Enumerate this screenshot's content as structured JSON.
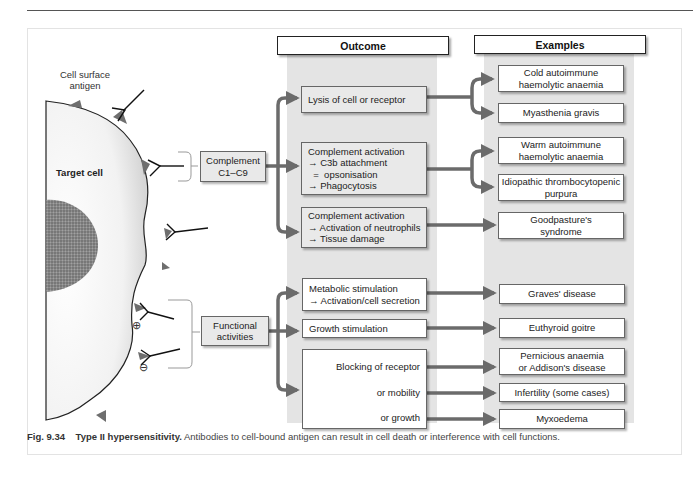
{
  "headers": {
    "outcome": "Outcome",
    "examples": "Examples"
  },
  "cell": {
    "antigen_label_1": "Cell surface",
    "antigen_label_2": "antigen",
    "target_cell_label": "Target cell",
    "plus_sign": "⊕",
    "minus_sign": "⊖"
  },
  "mechanisms": {
    "complement": {
      "line1": "Complement",
      "line2": "C1–C9"
    },
    "functional": {
      "line1": "Functional",
      "line2": "activities"
    }
  },
  "outcomes": [
    {
      "lines": [
        "Lysis of cell or receptor"
      ]
    },
    {
      "lines": [
        "Complement activation",
        "→ C3b attachment",
        "  =  opsonisation",
        "→ Phagocytosis"
      ]
    },
    {
      "lines": [
        "Complement activation",
        "→ Activation of neutrophils",
        "→ Tissue damage"
      ]
    },
    {
      "lines": [
        "Metabolic stimulation",
        "→ Activation/cell secretion"
      ]
    },
    {
      "lines": [
        "Growth stimulation"
      ]
    },
    {
      "lines": [
        "Blocking of receptor",
        "or mobility",
        "or growth"
      ]
    }
  ],
  "examples": [
    {
      "lines": [
        "Cold autoimmune",
        "haemolytic anaemia"
      ]
    },
    {
      "lines": [
        "Myasthenia gravis"
      ]
    },
    {
      "lines": [
        "Warm autoimmune",
        "haemolytic anaemia"
      ]
    },
    {
      "lines": [
        "Idiopathic thrombocytopenic",
        "purpura"
      ]
    },
    {
      "lines": [
        "Goodpasture's",
        "syndrome"
      ]
    },
    {
      "lines": [
        "Graves' disease"
      ]
    },
    {
      "lines": [
        "Euthyroid goitre"
      ]
    },
    {
      "lines": [
        "Pernicious anaemia",
        "or Addison's disease"
      ]
    },
    {
      "lines": [
        "Infertility (some cases)"
      ]
    },
    {
      "lines": [
        "Myxoedema"
      ]
    }
  ],
  "caption": {
    "fig_number": "Fig. 9.34",
    "title": "Type II hypersensitivity.",
    "text": "Antibodies to cell-bound antigen can result in cell death or interference with cell functions."
  },
  "colors": {
    "arrow": "#6b6b6b",
    "column_band": "#e4e4e4",
    "cell_fill": "#f0f0f0",
    "antigen": "#6e6e6e"
  }
}
